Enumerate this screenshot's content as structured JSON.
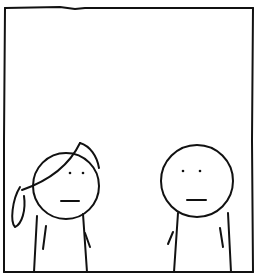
{
  "comic": {
    "style": "stick-figure comic panel",
    "line_color": "#111111",
    "background_color": "#ffffff",
    "panel_count": 1,
    "characters": [
      {
        "id": "left",
        "description": "girl with ponytail, neutral expression",
        "hair": "ponytail"
      },
      {
        "id": "right",
        "description": "bald round-headed figure, neutral expression",
        "hair": "none"
      }
    ],
    "dialogue": []
  }
}
